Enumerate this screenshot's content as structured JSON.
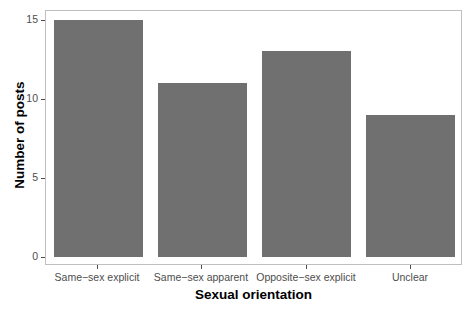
{
  "chart_data": {
    "type": "bar",
    "title": "",
    "subtitle": "",
    "xlabel": "Sexual orientation",
    "ylabel": "Number of posts",
    "categories": [
      "Same−sex explicit",
      "Same−sex apparent",
      "Opposite−sex explicit",
      "Unclear"
    ],
    "values": [
      15,
      11,
      13,
      9
    ],
    "ylim": [
      0,
      15.6
    ],
    "y_ticks": [
      0,
      5,
      10,
      15
    ],
    "y_tick_labels": [
      "0",
      "5",
      "10",
      "15"
    ],
    "grid": false,
    "legend": null,
    "legend_position": "none",
    "bar_color": "#707070",
    "panel_border_color": "#bfbfbf",
    "axis_text_color": "#4d4d4d",
    "background_color": "#ffffff",
    "series": [
      {
        "name": "Number of posts",
        "values": [
          15,
          11,
          13,
          9
        ]
      }
    ],
    "annotations": []
  }
}
